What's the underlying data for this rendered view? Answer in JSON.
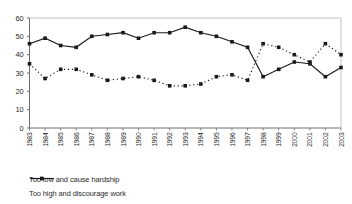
{
  "chart_data": {
    "type": "line",
    "title": "",
    "xlabel": "",
    "ylabel": "",
    "x": [
      1983,
      1984,
      1985,
      1986,
      1987,
      1988,
      1989,
      1990,
      1991,
      1992,
      1993,
      1994,
      1995,
      1996,
      1997,
      1998,
      1999,
      2000,
      2001,
      2002,
      2003
    ],
    "series": [
      {
        "name": "Too low and cause hardship",
        "line_style": "solid",
        "marker": "square",
        "values": [
          46,
          49,
          45,
          44,
          50,
          51,
          52,
          49,
          52,
          52,
          55,
          52,
          50,
          47,
          44,
          28,
          32,
          36,
          35,
          28,
          33
        ]
      },
      {
        "name": "Too high and discourage work",
        "line_style": "dotted",
        "marker": "square",
        "values": [
          35,
          27,
          32,
          32,
          29,
          26,
          27,
          28,
          26,
          23,
          23,
          24,
          28,
          29,
          26,
          46,
          44,
          40,
          36,
          46,
          40
        ]
      }
    ],
    "ylim": [
      0,
      60
    ],
    "yticks": [
      0,
      10,
      20,
      30,
      40,
      50,
      60
    ],
    "grid": false,
    "legend_position": "bottom-left",
    "colors": {
      "series": "#1a1a1a",
      "axis": "#6e6e6e",
      "plot_border": "#c3c3c3",
      "tick_text": "#2b2b2b"
    }
  }
}
